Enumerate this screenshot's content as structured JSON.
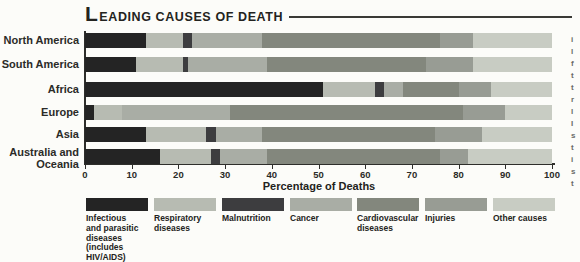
{
  "title": {
    "lead": "L",
    "rest": "EADING CAUSES OF DEATH"
  },
  "axis": {
    "ticks": [
      0,
      10,
      20,
      30,
      40,
      50,
      60,
      70,
      80,
      90,
      100
    ]
  },
  "chart_data": {
    "type": "bar",
    "stacked": true,
    "orientation": "horizontal",
    "xlabel": "Percentage of Deaths",
    "xlim": [
      0,
      100
    ],
    "grid": false,
    "legend_position": "bottom",
    "categories": [
      "North America",
      "South America",
      "Africa",
      "Europe",
      "Asia",
      "Australia and Oceania"
    ],
    "series": [
      {
        "name": "Infectious and parasitic diseases (includes HIV/AIDS)",
        "legend_lines": [
          "Infectious",
          "and parasitic",
          "diseases",
          "(includes",
          "HIV/AIDS)"
        ],
        "color": "#242424",
        "values": [
          13,
          11,
          51,
          2,
          13,
          16
        ]
      },
      {
        "name": "Respiratory diseases",
        "legend_lines": [
          "Respiratory",
          "diseases"
        ],
        "color": "#b7bbb2",
        "values": [
          8,
          10,
          11,
          6,
          13,
          11
        ]
      },
      {
        "name": "Malnutrition",
        "legend_lines": [
          "Malnutrition"
        ],
        "color": "#3d3d3f",
        "values": [
          2,
          1,
          2,
          0,
          2,
          2
        ]
      },
      {
        "name": "Cancer",
        "legend_lines": [
          "Cancer"
        ],
        "color": "#a9ada5",
        "values": [
          15,
          17,
          4,
          23,
          10,
          10
        ]
      },
      {
        "name": "Cardiovascular diseases",
        "legend_lines": [
          "Cardiovascular",
          "diseases"
        ],
        "color": "#83877d",
        "values": [
          38,
          34,
          12,
          50,
          37,
          37
        ]
      },
      {
        "name": "Injuries",
        "legend_lines": [
          "Injuries"
        ],
        "color": "#989c94",
        "values": [
          7,
          10,
          7,
          9,
          10,
          6
        ]
      },
      {
        "name": "Other causes",
        "legend_lines": [
          "Other causes"
        ],
        "color": "#c8ccc3",
        "values": [
          17,
          17,
          13,
          10,
          15,
          18
        ]
      }
    ]
  },
  "edge_fragments": [
    "i",
    "l",
    "f",
    "t",
    "t",
    "r",
    "l",
    "I",
    "s",
    "t",
    "i",
    "s",
    "t"
  ]
}
